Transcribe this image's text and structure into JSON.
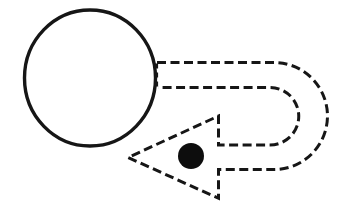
{
  "canvas": {
    "width": 339,
    "height": 214,
    "viewbox": "0 0 339 214",
    "background": "#ffffff"
  },
  "palette": {
    "ink": "#161616",
    "dot_fill": "#0d0d0d"
  },
  "circle": {
    "cx": 90,
    "cy": 78,
    "rx": 65.5,
    "ry": 68,
    "stroke_width": 3.4
  },
  "uturn_arrow": {
    "path": "M 157 62.5 H 274 A 53.5 53.5 0 0 1 274 169.5 H 218.5 V 198.3 L 128 157.5 L 218.5 116 V 145 H 270 A 28.75 28.75 0 0 0 270 87.5 H 158",
    "dash": "9 4.5",
    "stroke_width": 3
  },
  "shaft_closure": {
    "x1": 156.5,
    "y1": 63.5,
    "x2": 156.5,
    "y2": 86.5,
    "dash": "5 4",
    "stroke_width": 3.2
  },
  "dot": {
    "cx": 191,
    "cy": 156,
    "r": 13
  }
}
